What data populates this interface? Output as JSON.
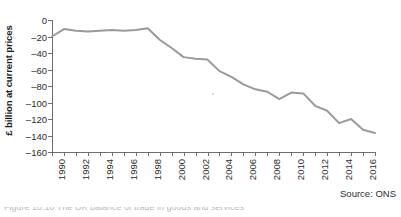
{
  "source_note": "Source: ONS",
  "caption_clipped": "Figure 10.10 The UK balance of trade in goods and services",
  "chart_data": {
    "type": "line",
    "title": "",
    "subtitle": "",
    "xlabel": "",
    "ylabel": "£ billion at current prices",
    "xlim": [
      1990,
      2017
    ],
    "ylim": [
      -160,
      0
    ],
    "grid": false,
    "legend": false,
    "legend_position": "none",
    "line_color": "#9a9a9a",
    "line_width": 2,
    "y_ticks": [
      0,
      -20,
      -40,
      -60,
      -80,
      -100,
      -120,
      -140,
      -160
    ],
    "y_tick_labels": [
      "0",
      "–20",
      "–40",
      "–60",
      "–80",
      "–100",
      "–120",
      "–140",
      "–160"
    ],
    "x_ticks": [
      1990,
      1991,
      1992,
      1993,
      1994,
      1995,
      1996,
      1997,
      1998,
      1999,
      2000,
      2001,
      2002,
      2003,
      2004,
      2005,
      2006,
      2007,
      2008,
      2009,
      2010,
      2011,
      2012,
      2013,
      2014,
      2015,
      2016,
      2017
    ],
    "x_tick_labels": [
      "1990",
      "",
      "1992",
      "",
      "1994",
      "",
      "1996",
      "",
      "1998",
      "",
      "2000",
      "",
      "2002",
      "",
      "2004",
      "",
      "2006",
      "",
      "2008",
      "",
      "2010",
      "",
      "2012",
      "",
      "2014",
      "",
      "2016",
      ""
    ],
    "x": [
      1990,
      1991,
      1992,
      1993,
      1994,
      1995,
      1996,
      1997,
      1998,
      1999,
      2000,
      2001,
      2002,
      2003,
      2004,
      2005,
      2006,
      2007,
      2008,
      2009,
      2010,
      2011,
      2012,
      2013,
      2014,
      2015,
      2016,
      2017
    ],
    "values": [
      -20,
      -11,
      -13,
      -14,
      -13,
      -12,
      -13,
      -12,
      -10,
      -24,
      -34,
      -45,
      -47,
      -48,
      -62,
      -69,
      -78,
      -84,
      -87,
      -96,
      -88,
      -89,
      -104,
      -110,
      -125,
      -120,
      -133,
      -137
    ],
    "series": [
      {
        "name": "Balance of trade",
        "values": [
          -20,
          -11,
          -13,
          -14,
          -13,
          -12,
          -13,
          -12,
          -10,
          -24,
          -34,
          -45,
          -47,
          -48,
          -62,
          -69,
          -78,
          -84,
          -87,
          -96,
          -88,
          -89,
          -104,
          -110,
          -125,
          -120,
          -133,
          -137
        ]
      }
    ]
  }
}
